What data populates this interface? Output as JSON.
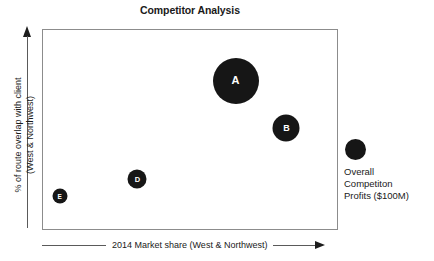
{
  "chart_data": {
    "type": "scatter",
    "title": "Competitor Analysis",
    "xlabel": "2014 Market share (West & Northwest)",
    "ylabel_line1": "% of route overlap with client",
    "ylabel_line2": "(West & Northwest)",
    "ylabel": "% of route overlap with client (West & Northwest)",
    "grid": false,
    "axis_ticks": false,
    "xlim": [
      0,
      100
    ],
    "ylim": [
      0,
      100
    ],
    "legend_position": "right",
    "bubble_color": "#161616",
    "frame_color": "#8c8c8c",
    "axis_color": "#5a5a5a",
    "size_meaning": "Overall Competiton Profits ($100M)",
    "points": [
      {
        "label": "A",
        "x": 65.5,
        "y": 74.6,
        "size_px": 46,
        "label_font_px": 11
      },
      {
        "label": "B",
        "x": 82.8,
        "y": 50.7,
        "size_px": 27,
        "label_font_px": 9
      },
      {
        "label": "D",
        "x": 32.1,
        "y": 24.9,
        "size_px": 19,
        "label_font_px": 7.5
      },
      {
        "label": "E",
        "x": 5.7,
        "y": 16.4,
        "size_px": 15,
        "label_font_px": 6.5
      }
    ]
  },
  "legend": {
    "bubble_name": "overall-competiton-profits-bubble",
    "line1": "Overall",
    "line2": "Competiton",
    "line3": "Profits ($100M)"
  },
  "axes": {
    "x_arrow_direction": "right",
    "y_arrow_direction": "up"
  }
}
